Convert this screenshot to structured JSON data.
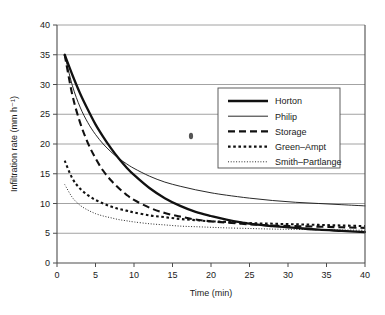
{
  "chart_data": {
    "type": "line",
    "title": "",
    "xlabel": "Time (min)",
    "ylabel": "Infiltration rate (mm h⁻¹)",
    "xlim": [
      0,
      40
    ],
    "ylim": [
      0,
      40
    ],
    "xticks": [
      0,
      5,
      10,
      15,
      20,
      25,
      30,
      35,
      40
    ],
    "yticks": [
      0,
      5,
      10,
      15,
      20,
      25,
      30,
      35,
      40
    ],
    "grid": "horizontal",
    "legend_position": "upper-right-inside",
    "series": [
      {
        "name": "Horton",
        "style": "thick-solid",
        "x": [
          1,
          2,
          3,
          4,
          5,
          6,
          7,
          8,
          9,
          10,
          12,
          14,
          16,
          18,
          20,
          22,
          25,
          28,
          31,
          34,
          37,
          40
        ],
        "values": [
          35.0,
          31.6,
          28.5,
          25.8,
          23.3,
          21.2,
          19.3,
          17.6,
          16.1,
          14.8,
          12.6,
          10.9,
          9.6,
          8.6,
          7.9,
          7.3,
          6.6,
          6.2,
          5.9,
          5.6,
          5.4,
          5.2
        ]
      },
      {
        "name": "Philip",
        "style": "thin-solid",
        "x": [
          1,
          2,
          3,
          4,
          5,
          6,
          7,
          8,
          9,
          10,
          12,
          14,
          16,
          18,
          20,
          22,
          25,
          28,
          31,
          34,
          37,
          40
        ],
        "values": [
          35.0,
          29.8,
          26.2,
          23.6,
          21.6,
          20.0,
          18.7,
          17.6,
          16.7,
          15.9,
          14.6,
          13.6,
          12.9,
          12.3,
          11.8,
          11.4,
          10.9,
          10.5,
          10.2,
          10.0,
          9.8,
          9.6
        ]
      },
      {
        "name": "Storage",
        "style": "dashed",
        "x": [
          1,
          2,
          3,
          4,
          5,
          6,
          7,
          8,
          9,
          10,
          12,
          14,
          16,
          18,
          20,
          22,
          25,
          28,
          31,
          34,
          37,
          40
        ],
        "values": [
          35.0,
          28.2,
          23.6,
          20.2,
          17.6,
          15.5,
          13.9,
          12.6,
          11.5,
          10.6,
          9.3,
          8.4,
          7.8,
          7.3,
          7.0,
          6.8,
          6.5,
          6.3,
          6.2,
          6.1,
          6.0,
          5.9
        ]
      },
      {
        "name": "Green–Ampt",
        "style": "dotted-square",
        "x": [
          1,
          2,
          3,
          4,
          5,
          6,
          7,
          8,
          9,
          10,
          12,
          14,
          16,
          18,
          20,
          22,
          25,
          28,
          31,
          34,
          37,
          40
        ],
        "values": [
          17.2,
          14.2,
          12.5,
          11.4,
          10.6,
          10.0,
          9.5,
          9.1,
          8.8,
          8.5,
          8.0,
          7.7,
          7.4,
          7.2,
          7.0,
          6.9,
          6.7,
          6.6,
          6.5,
          6.4,
          6.3,
          6.2
        ]
      },
      {
        "name": "Smith–Partlange",
        "style": "fine-dotted",
        "x": [
          1,
          2,
          3,
          4,
          5,
          6,
          7,
          8,
          9,
          10,
          12,
          14,
          16,
          18,
          20,
          22,
          25,
          28,
          31,
          34,
          37,
          40
        ],
        "values": [
          13.2,
          11.0,
          9.7,
          8.9,
          8.3,
          7.9,
          7.6,
          7.3,
          7.1,
          6.9,
          6.6,
          6.4,
          6.2,
          6.1,
          6.0,
          5.9,
          5.8,
          5.7,
          5.65,
          5.6,
          5.55,
          5.5
        ]
      }
    ]
  },
  "legend": {
    "entries": [
      {
        "label": "Horton"
      },
      {
        "label": "Philip"
      },
      {
        "label": "Storage"
      },
      {
        "label": "Green–Ampt"
      },
      {
        "label": "Smith–Partlange"
      }
    ]
  }
}
